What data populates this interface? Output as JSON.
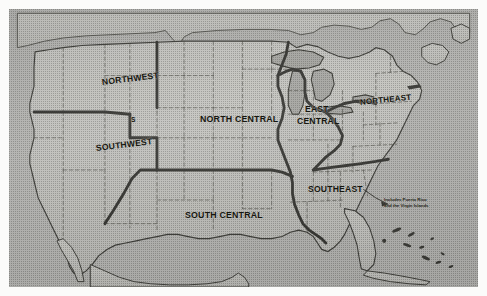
{
  "document": {
    "kind": "scanned-figure",
    "subject": "Map of the United States divided into seven administrative regions",
    "frame_color": "#4a4a48",
    "plate_color": "#a8a8a4",
    "ink_color": "#16160f"
  },
  "map": {
    "title": "United States Regions",
    "regions": [
      {
        "id": "northwest",
        "label": "NORTHWEST",
        "x": 93,
        "y": 72,
        "font_size": 8.6,
        "rotate": -7,
        "lines": [
          "NORTHWEST"
        ]
      },
      {
        "id": "southwest",
        "label": "SOUTHWEST",
        "x": 87,
        "y": 138,
        "font_size": 8.6,
        "rotate": -7,
        "lines": [
          "SOUTHWEST"
        ]
      },
      {
        "id": "north-central",
        "label": "NORTH CENTRAL",
        "x": 191,
        "y": 110,
        "font_size": 8.8,
        "rotate": 0,
        "lines": [
          "NORTH CENTRAL"
        ]
      },
      {
        "id": "south-central",
        "label": "SOUTH CENTRAL",
        "x": 176,
        "y": 206,
        "font_size": 8.8,
        "rotate": 0,
        "lines": [
          "SOUTH CENTRAL"
        ]
      },
      {
        "id": "east-central",
        "label": "EAST CENTRAL",
        "x": 296,
        "y": 100,
        "font_size": 8.6,
        "rotate": 0,
        "lines": [
          "EAST",
          "CENTRAL"
        ]
      },
      {
        "id": "northeast",
        "label": "NORTHEAST",
        "x": 351,
        "y": 95,
        "font_size": 8.0,
        "rotate": -6,
        "lines": [
          "NORTHEAST"
        ]
      },
      {
        "id": "southeast",
        "label": "SOUTHEAST",
        "x": 299,
        "y": 180,
        "font_size": 8.6,
        "rotate": 0,
        "lines": [
          "SOUTHEAST"
        ]
      }
    ],
    "annotations": [
      {
        "id": "southeast-territories-note",
        "text": "Includes Puerto Rico\nand the Virgin Islands",
        "x": 375,
        "y": 192,
        "leader_from": [
          373,
          196
        ],
        "leader_to": [
          352,
          189
        ]
      }
    ],
    "stray_marks": [
      {
        "id": "idaho-utah-tick",
        "label": "S",
        "x": 122,
        "y": 112,
        "font_size": 6.5
      }
    ],
    "legend_note": "Heavy solid lines mark region boundaries; dashed lines mark state boundaries."
  }
}
